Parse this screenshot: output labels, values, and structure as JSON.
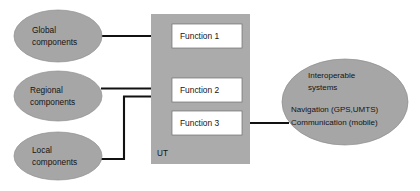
{
  "canvas": {
    "width": 420,
    "height": 191,
    "background": "#ffffff"
  },
  "colors": {
    "ellipse_fill": "#a6a6a6",
    "ellipse_stroke": "#8e8e8e",
    "panel_fill": "#ababab",
    "function_box_fill": "#ffffff",
    "function_box_stroke": "#6e6e6e",
    "connector": "#111111",
    "text": "#141414"
  },
  "sources": {
    "global": {
      "line1": "Global",
      "line2": "components"
    },
    "regional": {
      "line1": "Regional",
      "line2": "components"
    },
    "local": {
      "line1": "Local",
      "line2": "components"
    }
  },
  "panel": {
    "label": "UT",
    "functions": [
      {
        "label": "Function 1"
      },
      {
        "label": "Function 2"
      },
      {
        "label": "Function 3"
      }
    ]
  },
  "interoperable": {
    "title_line1": "Interoperable",
    "title_line2": "systems",
    "detail_line1": "Navigation (GPS,UMTS)",
    "detail_line2": "Communication (mobile)"
  },
  "connections": [
    {
      "from": "global",
      "to": "function-1"
    },
    {
      "from": "regional",
      "to": "function-2"
    },
    {
      "from": "local",
      "to": "function-2"
    },
    {
      "from": "interoperable",
      "to": "function-3"
    }
  ]
}
